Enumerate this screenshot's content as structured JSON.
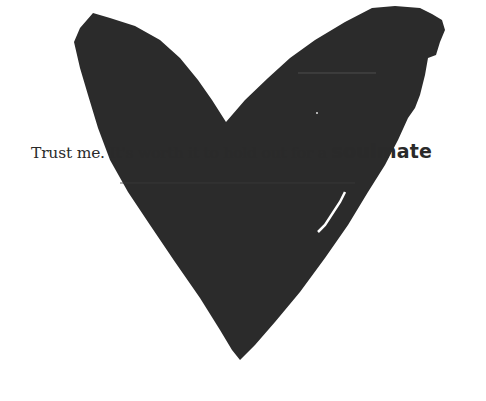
{
  "artwork": {
    "shape": "heart-icon",
    "fill_color": "#2b2b2b",
    "background_color": "#ffffff"
  },
  "caption": {
    "lead": "Trust me. It's worth it to hold out for a ",
    "emphasis": "soulmate",
    "text_color": "#2a2a2a"
  }
}
